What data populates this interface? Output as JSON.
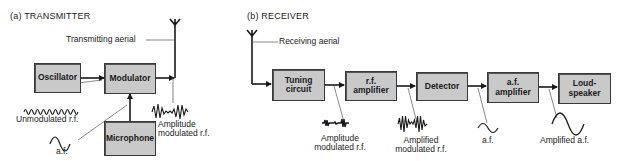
{
  "transmitter": {
    "title": "(a) TRANSMITTER",
    "aerial_label": "Transmitting aerial",
    "blocks": {
      "oscillator": "Oscillator",
      "modulator": "Modulator",
      "microphone": "Microphone"
    },
    "signals": {
      "unmodulated_rf": "Unmodulated r.f.",
      "af": "a.f.",
      "am_rf_line1": "Amplitude",
      "am_rf_line2": "modulated r.f."
    }
  },
  "receiver": {
    "title": "(b) RECEIVER",
    "aerial_label": "Receiving aerial",
    "blocks": {
      "tuning_line1": "Tuning",
      "tuning_line2": "circuit",
      "rf_amp_line1": "r.f.",
      "rf_amp_line2": "amplifier",
      "detector": "Detector",
      "af_amp_line1": "a.f.",
      "af_amp_line2": "amplifier",
      "loudspeaker_line1": "Loud-",
      "loudspeaker_line2": "speaker"
    },
    "signals": {
      "am_rf_line1": "Amplitude",
      "am_rf_line2": "modulated r.f.",
      "amp_mod_rf_line1": "Amplified",
      "amp_mod_rf_line2": "modulated r.f.",
      "af": "a.f.",
      "amplified_af": "Amplified a.f."
    }
  },
  "colors": {
    "block_fill": "#c9c9c9",
    "line": "#1a1a1a",
    "background": "#ffffff"
  }
}
